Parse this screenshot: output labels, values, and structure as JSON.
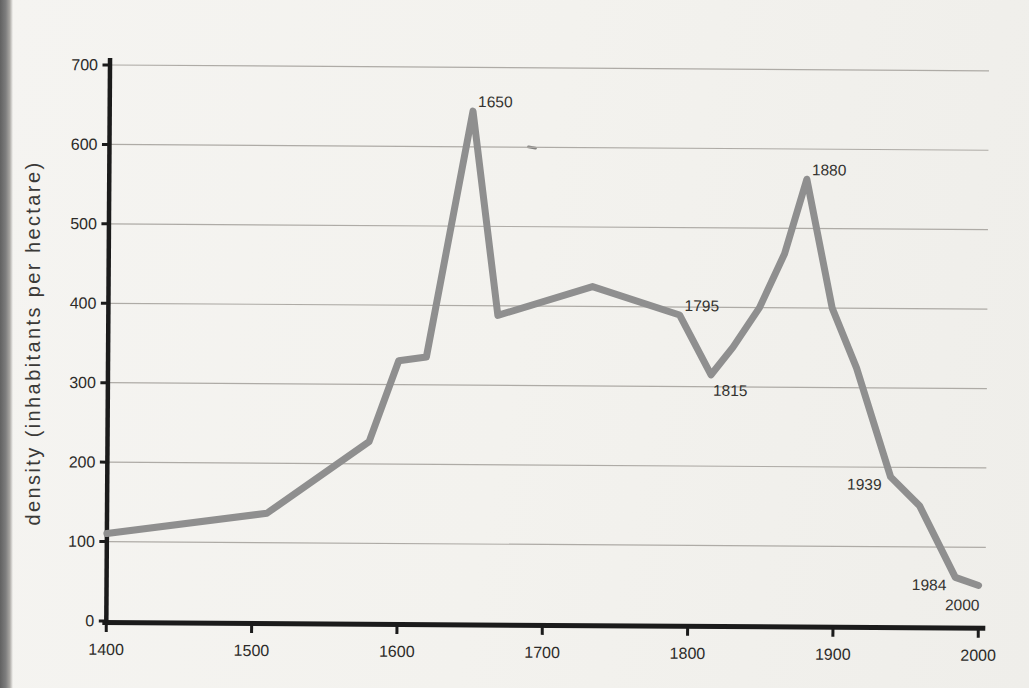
{
  "page": {
    "background_color": "#f3f2ee",
    "gutter_color": "#7e7e7e"
  },
  "chart_data": {
    "type": "line",
    "title": "",
    "xlabel": "",
    "ylabel": "density (inhabitants per hectare)",
    "xlim": [
      1400,
      2000
    ],
    "ylim": [
      0,
      700
    ],
    "x_ticks": [
      1400,
      1500,
      1600,
      1700,
      1800,
      1900,
      2000
    ],
    "y_ticks": [
      0,
      100,
      200,
      300,
      400,
      500,
      600,
      700
    ],
    "grid": "horizontal-only",
    "legend": "none",
    "line_color": "#8f8f8f",
    "axis_color": "#1b1b1b",
    "grid_color": "#aeaba6",
    "series": [
      {
        "name": "density",
        "points": [
          {
            "x": 1400,
            "y": 110
          },
          {
            "x": 1510,
            "y": 137
          },
          {
            "x": 1580,
            "y": 228
          },
          {
            "x": 1600,
            "y": 330
          },
          {
            "x": 1619,
            "y": 335
          },
          {
            "x": 1650,
            "y": 645
          },
          {
            "x": 1668,
            "y": 388
          },
          {
            "x": 1733,
            "y": 425
          },
          {
            "x": 1793,
            "y": 390
          },
          {
            "x": 1815,
            "y": 315
          },
          {
            "x": 1830,
            "y": 350
          },
          {
            "x": 1848,
            "y": 400
          },
          {
            "x": 1865,
            "y": 468
          },
          {
            "x": 1880,
            "y": 562
          },
          {
            "x": 1898,
            "y": 400
          },
          {
            "x": 1915,
            "y": 325
          },
          {
            "x": 1939,
            "y": 188
          },
          {
            "x": 1959,
            "y": 152
          },
          {
            "x": 1984,
            "y": 62
          },
          {
            "x": 2000,
            "y": 52
          }
        ]
      }
    ],
    "annotations": [
      {
        "label": "1650",
        "x": 1650,
        "y": 645,
        "placement": "above-right"
      },
      {
        "label": "1795",
        "x": 1793,
        "y": 390,
        "placement": "above-right"
      },
      {
        "label": "1815",
        "x": 1815,
        "y": 315,
        "placement": "below-right"
      },
      {
        "label": "1880",
        "x": 1880,
        "y": 562,
        "placement": "above-right"
      },
      {
        "label": "1939",
        "x": 1939,
        "y": 188,
        "placement": "left-below"
      },
      {
        "label": "1984",
        "x": 1984,
        "y": 62,
        "placement": "left-below"
      },
      {
        "label": "2000",
        "x": 2000,
        "y": 52,
        "placement": "below-left"
      }
    ]
  }
}
